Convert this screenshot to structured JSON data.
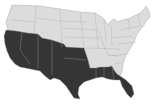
{
  "map": {
    "subject": "Contiguous United States",
    "style": "grayscale choropleth",
    "colors": {
      "background": "#ffffff",
      "unshaded_fill": "#dcdcdc",
      "shaded_fill": "#353535",
      "state_border": "#9a9a9a"
    },
    "shaded_region": {
      "description": "Southern / southwestern states shaded dark",
      "states": [
        "California",
        "Nevada",
        "Arizona",
        "Utah",
        "New Mexico",
        "Colorado",
        "Oklahoma",
        "Texas",
        "Louisiana",
        "Mississippi",
        "Alabama",
        "Florida"
      ]
    },
    "unshaded_region": {
      "description": "Remaining northern and eastern states shown in light gray"
    }
  }
}
